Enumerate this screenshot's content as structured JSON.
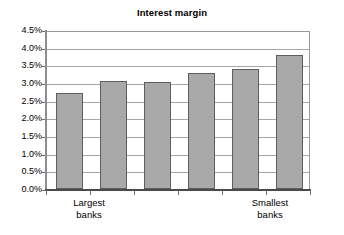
{
  "chart_data": {
    "type": "bar",
    "title": "Interest margin",
    "xlabel": "",
    "ylabel": "",
    "categories": [
      "",
      "",
      "",
      "",
      "",
      ""
    ],
    "values": [
      2.71,
      3.05,
      3.02,
      3.28,
      3.39,
      3.79
    ],
    "value_unit": "%",
    "ylim": [
      0.0,
      4.5
    ],
    "ytick_values": [
      0.0,
      0.5,
      1.0,
      1.5,
      2.0,
      2.5,
      3.0,
      3.5,
      4.0,
      4.5
    ],
    "ytick_labels": [
      "0.0%",
      "0.5%",
      "1.0%",
      "1.5%",
      "2.0%",
      "2.5%",
      "3.0%",
      "3.5%",
      "4.0%",
      "4.5%"
    ],
    "grid": true,
    "grid_axis": "y",
    "legend": false,
    "legend_position": "none",
    "bar_color": "#a9a9a9",
    "bar_border_color": "#5e5e5e",
    "axis_color": "#4a4a4a",
    "gridline_color": "#a6a6a6",
    "background": "#ffffff",
    "annotations": []
  },
  "axis": {
    "x_category_labels": {
      "left": {
        "line1": "Largest",
        "line2": "banks"
      },
      "right": {
        "line1": "Smallest",
        "line2": "banks"
      }
    }
  }
}
